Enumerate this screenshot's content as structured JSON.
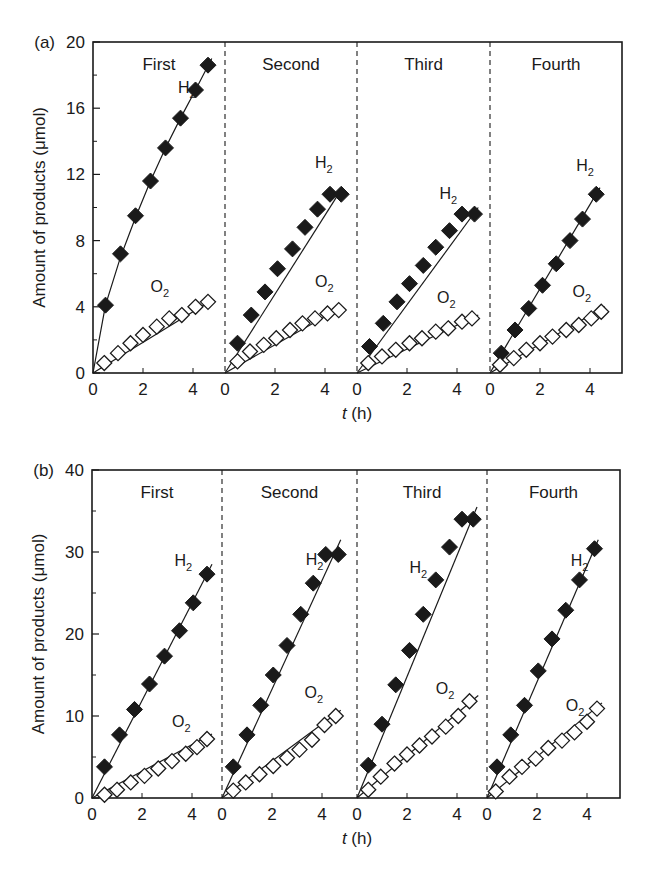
{
  "figure": {
    "x_axis_title_italic": "t",
    "x_axis_title_rest": " (h)",
    "y_axis_title": "Amount of products (μmol)"
  },
  "chart_data": [
    {
      "type": "scatter",
      "panel": "(a)",
      "title": "",
      "xlabel": "t (h)",
      "ylabel": "Amount of products (μmol)",
      "ylim": [
        0,
        20
      ],
      "yticks": [
        0,
        4,
        8,
        12,
        16,
        20
      ],
      "yminor": [
        2,
        6,
        10,
        14,
        18
      ],
      "xticks": [
        0,
        2,
        4
      ],
      "xlim_per_run": [
        0,
        5.3
      ],
      "grid": false,
      "legend": "inline labels",
      "markers": {
        "H2": "filled diamond",
        "O2": "open diamond"
      },
      "runs": [
        {
          "label": "First",
          "series": [
            {
              "name": "H2",
              "x": [
                0.5,
                1.1,
                1.7,
                2.3,
                2.9,
                3.5,
                4.1,
                4.6
              ],
              "values": [
                4.1,
                7.2,
                9.5,
                11.6,
                13.6,
                15.4,
                17.1,
                18.6
              ],
              "fit": [
                [
                  0,
                  0
                ],
                [
                  0.5,
                  4.1
                ],
                [
                  1.1,
                  7.0
                ],
                [
                  1.7,
                  9.4
                ],
                [
                  2.3,
                  11.6
                ],
                [
                  2.9,
                  13.6
                ],
                [
                  3.5,
                  15.4
                ],
                [
                  4.1,
                  17.1
                ],
                [
                  4.75,
                  19.0
                ]
              ]
            },
            {
              "name": "O2",
              "x": [
                0.45,
                1.0,
                1.5,
                2.0,
                2.55,
                3.05,
                3.55,
                4.1,
                4.6
              ],
              "values": [
                0.6,
                1.2,
                1.8,
                2.3,
                2.8,
                3.3,
                3.5,
                4.0,
                4.3
              ],
              "fit": [
                [
                  0,
                  0
                ],
                [
                  4.75,
                  4.4
                ]
              ]
            }
          ],
          "label_pos": {
            "H2": [
              3.4,
              16.9
            ],
            "O2": [
              2.3,
              4.9
            ]
          }
        },
        {
          "label": "Second",
          "series": [
            {
              "name": "H2",
              "x": [
                0.5,
                1.05,
                1.6,
                2.1,
                2.7,
                3.2,
                3.7,
                4.2,
                4.65
              ],
              "values": [
                1.8,
                3.5,
                4.9,
                6.3,
                7.5,
                8.8,
                9.9,
                10.8,
                10.8
              ],
              "fit": [
                [
                  0,
                  0
                ],
                [
                  4.7,
                  11.2
                ]
              ]
            },
            {
              "name": "O2",
              "x": [
                0.5,
                1.0,
                1.55,
                2.05,
                2.6,
                3.1,
                3.6,
                4.1,
                4.55
              ],
              "values": [
                0.7,
                1.3,
                1.7,
                2.1,
                2.6,
                3.0,
                3.3,
                3.6,
                3.8
              ],
              "fit": [
                [
                  0,
                  0
                ],
                [
                  4.7,
                  4.0
                ]
              ]
            }
          ],
          "label_pos": {
            "H2": [
              3.6,
              12.4
            ],
            "O2": [
              3.6,
              5.2
            ]
          }
        },
        {
          "label": "Third",
          "series": [
            {
              "name": "H2",
              "x": [
                0.5,
                1.05,
                1.6,
                2.1,
                2.65,
                3.15,
                3.7,
                4.2,
                4.7
              ],
              "values": [
                1.6,
                3.0,
                4.3,
                5.4,
                6.5,
                7.6,
                8.6,
                9.6,
                9.6
              ],
              "fit": [
                [
                  0,
                  0
                ],
                [
                  4.85,
                  10.0
                ]
              ]
            },
            {
              "name": "O2",
              "x": [
                0.45,
                1.0,
                1.55,
                2.1,
                2.6,
                3.15,
                3.65,
                4.2,
                4.6
              ],
              "values": [
                0.6,
                1.0,
                1.4,
                1.8,
                2.1,
                2.5,
                2.7,
                3.1,
                3.3
              ],
              "fit": [
                [
                  0,
                  0
                ],
                [
                  4.85,
                  3.5
                ]
              ]
            }
          ],
          "label_pos": {
            "H2": [
              3.3,
              10.5
            ],
            "O2": [
              3.2,
              4.2
            ]
          }
        },
        {
          "label": "Fourth",
          "series": [
            {
              "name": "H2",
              "x": [
                0.45,
                1.0,
                1.55,
                2.1,
                2.65,
                3.2,
                3.7,
                4.25
              ],
              "values": [
                1.2,
                2.6,
                3.9,
                5.3,
                6.6,
                8.0,
                9.3,
                10.8
              ],
              "fit": [
                [
                  0,
                  0
                ],
                [
                  4.4,
                  11.2
                ]
              ]
            },
            {
              "name": "O2",
              "x": [
                0.4,
                0.95,
                1.45,
                2.0,
                2.5,
                3.05,
                3.55,
                4.05,
                4.45
              ],
              "values": [
                0.5,
                0.9,
                1.4,
                1.8,
                2.2,
                2.6,
                2.9,
                3.3,
                3.7
              ],
              "fit": [
                [
                  0,
                  0
                ],
                [
                  4.6,
                  4.0
                ]
              ]
            }
          ],
          "label_pos": {
            "H2": [
              3.45,
              12.2
            ],
            "O2": [
              3.3,
              4.6
            ]
          }
        }
      ]
    },
    {
      "type": "scatter",
      "panel": "(b)",
      "title": "",
      "xlabel": "t (h)",
      "ylabel": "Amount of products (μmol)",
      "ylim": [
        0,
        40
      ],
      "yticks": [
        0,
        10,
        20,
        30,
        40
      ],
      "yminor": [
        5,
        15,
        25,
        35
      ],
      "xticks": [
        0,
        2,
        4
      ],
      "xlim_per_run": [
        0,
        5.3
      ],
      "grid": false,
      "legend": "inline labels",
      "markers": {
        "H2": "filled diamond",
        "O2": "open diamond"
      },
      "runs": [
        {
          "label": "First",
          "series": [
            {
              "name": "H2",
              "x": [
                0.5,
                1.1,
                1.7,
                2.3,
                2.9,
                3.5,
                4.05,
                4.6
              ],
              "values": [
                3.8,
                7.7,
                10.8,
                13.9,
                17.3,
                20.4,
                23.8,
                27.3
              ],
              "fit": [
                [
                  0,
                  0
                ],
                [
                  4.8,
                  28.5
                ]
              ]
            },
            {
              "name": "O2",
              "x": [
                0.5,
                1.0,
                1.55,
                2.1,
                2.65,
                3.2,
                3.75,
                4.2,
                4.6
              ],
              "values": [
                0.4,
                1.0,
                1.9,
                2.7,
                3.6,
                4.5,
                5.4,
                6.2,
                7.2
              ],
              "fit": [
                [
                  0,
                  0
                ],
                [
                  4.8,
                  7.8
                ]
              ]
            }
          ],
          "label_pos": {
            "H2": [
              3.3,
              28.3
            ],
            "O2": [
              3.2,
              8.7
            ]
          }
        },
        {
          "label": "Second",
          "series": [
            {
              "name": "H2",
              "x": [
                0.45,
                1.0,
                1.55,
                2.05,
                2.6,
                3.15,
                3.65,
                4.15,
                4.65
              ],
              "values": [
                3.8,
                7.7,
                11.3,
                15.0,
                18.6,
                22.4,
                26.2,
                29.7,
                29.7
              ],
              "fit": [
                [
                  0,
                  0
                ],
                [
                  4.75,
                  31.5
                ]
              ]
            },
            {
              "name": "O2",
              "x": [
                0.45,
                0.95,
                1.5,
                2.05,
                2.6,
                3.1,
                3.6,
                4.1,
                4.55
              ],
              "values": [
                0.9,
                1.9,
                2.9,
                3.9,
                4.9,
                5.9,
                7.1,
                8.9,
                10.0
              ],
              "fit": [
                [
                  0,
                  0
                ],
                [
                  4.75,
                  10.7
                ]
              ]
            }
          ],
          "label_pos": {
            "H2": [
              3.35,
              28.4
            ],
            "O2": [
              3.3,
              12.2
            ]
          }
        },
        {
          "label": "Third",
          "series": [
            {
              "name": "H2",
              "x": [
                0.45,
                1.0,
                1.55,
                2.1,
                2.65,
                3.15,
                3.7,
                4.2,
                4.65
              ],
              "values": [
                4.0,
                9.0,
                13.8,
                18.0,
                22.4,
                26.6,
                30.6,
                34.0,
                34.0
              ],
              "fit": [
                [
                  0,
                  0
                ],
                [
                  4.8,
                  35.5
                ]
              ]
            },
            {
              "name": "O2",
              "x": [
                0.45,
                0.95,
                1.5,
                2.0,
                2.5,
                3.0,
                3.55,
                4.05,
                4.5
              ],
              "values": [
                1.0,
                2.6,
                4.2,
                5.3,
                6.4,
                7.5,
                8.7,
                10.0,
                11.8
              ],
              "fit": [
                [
                  0,
                  0
                ],
                [
                  4.85,
                  12.5
                ]
              ]
            }
          ],
          "label_pos": {
            "H2": [
              2.1,
              27.5
            ],
            "O2": [
              3.15,
              12.7
            ]
          }
        },
        {
          "label": "Fourth",
          "series": [
            {
              "name": "H2",
              "x": [
                0.4,
                0.95,
                1.5,
                2.05,
                2.6,
                3.15,
                3.7,
                4.3
              ],
              "values": [
                3.8,
                7.7,
                11.3,
                15.5,
                19.4,
                22.9,
                26.6,
                30.4
              ],
              "fit": [
                [
                  0,
                  0
                ],
                [
                  4.45,
                  31.5
                ]
              ]
            },
            {
              "name": "O2",
              "x": [
                0.35,
                0.9,
                1.4,
                1.95,
                2.45,
                3.0,
                3.5,
                4.0,
                4.4
              ],
              "values": [
                0.8,
                2.6,
                3.8,
                4.8,
                6.1,
                7.0,
                8.0,
                9.3,
                10.9
              ],
              "fit": [
                [
                  0,
                  0
                ],
                [
                  4.6,
                  11.6
                ]
              ]
            }
          ],
          "label_pos": {
            "H2": [
              3.35,
              28.3
            ],
            "O2": [
              3.15,
              10.6
            ]
          }
        }
      ]
    }
  ],
  "layout": {
    "panels": [
      {
        "left": 93,
        "right": 622,
        "top": 42,
        "bottom": 373,
        "dividers": [
          225,
          357,
          490
        ]
      },
      {
        "left": 92,
        "right": 620,
        "top": 470,
        "bottom": 798,
        "dividers": [
          222,
          357,
          487
        ]
      }
    ],
    "px_per_hour": 25.0,
    "colors": {
      "ink": "#1a1a1a",
      "background": "#ffffff"
    }
  }
}
